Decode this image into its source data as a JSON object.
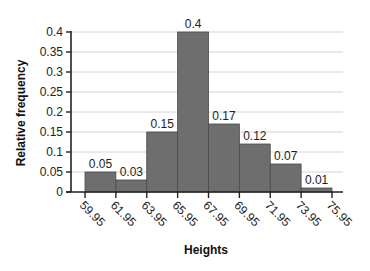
{
  "chart_data": {
    "type": "bar",
    "title": "",
    "xlabel": "Heights",
    "ylabel": "Relative frequency",
    "bin_edges": [
      "59.95",
      "61.95",
      "63.95",
      "65.95",
      "67.95",
      "69.95",
      "71.95",
      "73.95",
      "75.95"
    ],
    "categories": [
      "59.95-61.95",
      "61.95-63.95",
      "63.95-65.95",
      "65.95-67.95",
      "67.95-69.95",
      "69.95-71.95",
      "71.95-73.95",
      "73.95-75.95"
    ],
    "values": [
      0.05,
      0.03,
      0.15,
      0.4,
      0.17,
      0.12,
      0.07,
      0.01
    ],
    "data_labels": [
      "0.05",
      "0.03",
      "0.15",
      "0.4",
      "0.17",
      "0.12",
      "0.07",
      "0.01"
    ],
    "yticks": [
      "0",
      "0.05",
      "0.1",
      "0.15",
      "0.2",
      "0.25",
      "0.3",
      "0.35",
      "0.4"
    ],
    "ytick_values": [
      0,
      0.05,
      0.1,
      0.15,
      0.2,
      0.25,
      0.3,
      0.35,
      0.4
    ],
    "ylim": [
      0,
      0.4
    ],
    "grid": true,
    "legend": null,
    "colors": {
      "bar": "#6e6e6e",
      "bar_edge": "#4a4a4a",
      "grid": "#d4d4d4",
      "axis": "#222222"
    }
  }
}
